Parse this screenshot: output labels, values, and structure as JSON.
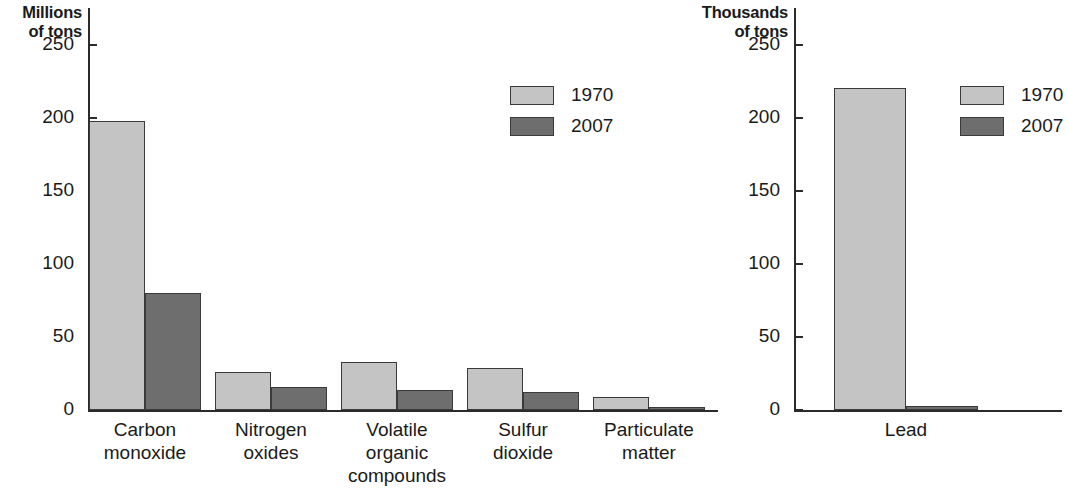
{
  "chart_data": [
    {
      "type": "bar",
      "title": "",
      "ylabel": "Millions\nof tons",
      "ylabel_lines": [
        "Millions",
        "of tons"
      ],
      "xlabel": "",
      "ylim": [
        0,
        275
      ],
      "yticks": [
        0,
        50,
        100,
        150,
        200,
        250
      ],
      "ytick_labels": [
        "0",
        "50",
        "100",
        "150",
        "200",
        "250"
      ],
      "grid": false,
      "legend_position": "upper-center-right",
      "categories": [
        "Carbon\nmonoxide",
        "Nitrogen\noxides",
        "Volatile\norganic\ncompounds",
        "Sulfur\ndioxide",
        "Particulate\nmatter"
      ],
      "series": [
        {
          "name": "1970",
          "color": "#c4c4c4",
          "values": [
            198,
            26,
            33,
            29,
            9
          ]
        },
        {
          "name": "2007",
          "color": "#6e6e6e",
          "values": [
            80,
            16,
            14,
            12,
            1.5
          ]
        }
      ]
    },
    {
      "type": "bar",
      "title": "",
      "ylabel": "Thousands\nof tons",
      "ylabel_lines": [
        "Thousands",
        "of tons"
      ],
      "xlabel": "",
      "ylim": [
        0,
        275
      ],
      "yticks": [
        0,
        50,
        100,
        150,
        200,
        250
      ],
      "ytick_labels": [
        "0",
        "50",
        "100",
        "150",
        "200",
        "250"
      ],
      "grid": false,
      "legend_position": "upper-right",
      "categories": [
        "Lead"
      ],
      "series": [
        {
          "name": "1970",
          "color": "#c4c4c4",
          "values": [
            220
          ]
        },
        {
          "name": "2007",
          "color": "#6e6e6e",
          "values": [
            3
          ]
        }
      ]
    }
  ],
  "colors": {
    "series_1970": "#c4c4c4",
    "series_2007": "#6e6e6e",
    "axis": "#2b2b2b",
    "bar_outline": "#3a3a3a",
    "text": "#1a1a1a",
    "background": "#ffffff"
  }
}
